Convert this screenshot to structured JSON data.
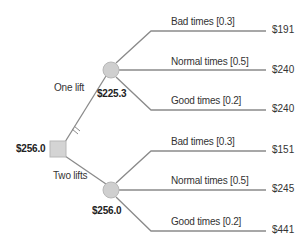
{
  "diagram": {
    "type": "decision-tree",
    "colors": {
      "line": "#8a8a8a",
      "node_fill": "#cfcfcf",
      "node_stroke": "#b8b8b8",
      "text": "#333333"
    },
    "decision_node": {
      "value": "$256.0"
    },
    "options": [
      {
        "label": "One lift",
        "pruned": true,
        "expected_value": "$225.3",
        "outcomes": [
          {
            "label": "Bad times [0.3]",
            "payoff": "$191"
          },
          {
            "label": "Normal times [0.5]",
            "payoff": "$240"
          },
          {
            "label": "Good times [0.2]",
            "payoff": "$240"
          }
        ]
      },
      {
        "label": "Two lifts",
        "pruned": false,
        "expected_value": "$256.0",
        "outcomes": [
          {
            "label": "Bad times [0.3]",
            "payoff": "$151"
          },
          {
            "label": "Normal times [0.5]",
            "payoff": "$245"
          },
          {
            "label": "Good times [0.2]",
            "payoff": "$441"
          }
        ]
      }
    ]
  }
}
